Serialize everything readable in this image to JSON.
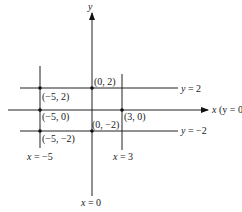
{
  "diagram": {
    "axes": {
      "y_axis_label": "y",
      "x_axis_label": "x (y = 0)",
      "x_axis_var": "x",
      "x_axis_paren": "(y = 0)"
    },
    "horizontal_lines": [
      {
        "label": "y = 2"
      },
      {
        "label": "x (y = 0)"
      },
      {
        "label": "y = −2"
      }
    ],
    "vertical_lines": [
      {
        "label": "x = −5"
      },
      {
        "label": "x = 0"
      },
      {
        "label": "x = 3"
      }
    ],
    "points": [
      {
        "label": "(−5, 2)"
      },
      {
        "label": "(0, 2)"
      },
      {
        "label": "(−5, 0)"
      },
      {
        "label": "(3, 0)"
      },
      {
        "label": "(−5, −2)"
      },
      {
        "label": "(0, −2)"
      }
    ],
    "colors": {
      "line": "#222222",
      "background": "#ffffff"
    }
  }
}
